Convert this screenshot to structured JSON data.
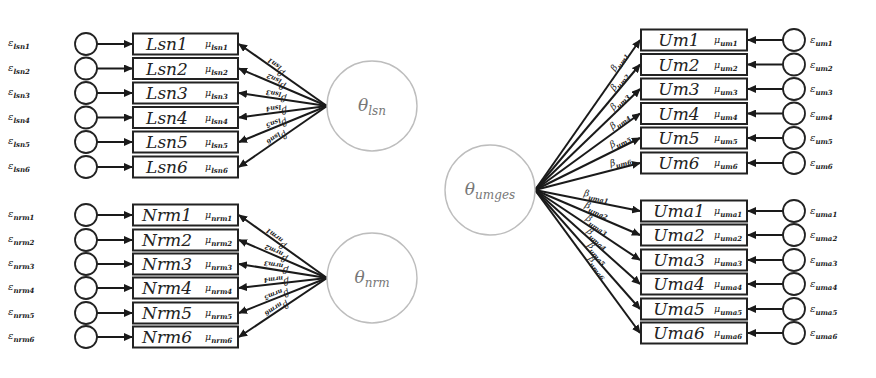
{
  "colors": {
    "line": "#1a1a1a",
    "box_stroke": "#222222",
    "latent_stroke": "#bdbdbd",
    "latent_text": "#777777",
    "background": "#ffffff"
  },
  "latents": {
    "lsn": {
      "symbol": "θ",
      "sub": "lsn",
      "cx": 372,
      "cy": 106,
      "r": 45
    },
    "nrm": {
      "symbol": "θ",
      "sub": "nrm",
      "cx": 372,
      "cy": 278,
      "r": 45
    },
    "umges": {
      "symbol": "θ",
      "sub": "umges",
      "cx": 490,
      "cy": 190,
      "r": 45
    }
  },
  "groups": {
    "lsn": {
      "side": "left",
      "latent": "lsn",
      "indicators": [
        {
          "label": "Lsn1",
          "mu": "lsn1",
          "err": "lsn1",
          "beta": "lsn1",
          "cy": 44
        },
        {
          "label": "Lsn2",
          "mu": "lsn2",
          "err": "lsn2",
          "beta": "lsn2",
          "cy": 68.5
        },
        {
          "label": "Lsn3",
          "mu": "lsn3",
          "err": "lsn3",
          "beta": "lsn3",
          "cy": 93
        },
        {
          "label": "Lsn4",
          "mu": "lsn4",
          "err": "lsn4",
          "beta": "lsn4",
          "cy": 117.5
        },
        {
          "label": "Lsn5",
          "mu": "lsn5",
          "err": "lsn5",
          "beta": "lsn5",
          "cy": 142
        },
        {
          "label": "Lsn6",
          "mu": "lsn6",
          "err": "lsn6",
          "beta": "lsn6",
          "cy": 167
        }
      ]
    },
    "nrm": {
      "side": "left",
      "latent": "nrm",
      "indicators": [
        {
          "label": "Nrm1",
          "mu": "nrm1",
          "err": "nrm1",
          "beta": "nrm1",
          "cy": 215
        },
        {
          "label": "Nrm2",
          "mu": "nrm2",
          "err": "nrm2",
          "beta": "nrm2",
          "cy": 240
        },
        {
          "label": "Nrm3",
          "mu": "nrm3",
          "err": "nrm3",
          "beta": "nrm3",
          "cy": 264
        },
        {
          "label": "Nrm4",
          "mu": "nrm4",
          "err": "nrm4",
          "beta": "nrm4",
          "cy": 288
        },
        {
          "label": "Nrm5",
          "mu": "nrm5",
          "err": "nrm5",
          "beta": "nrm5",
          "cy": 313
        },
        {
          "label": "Nrm6",
          "mu": "nrm6",
          "err": "nrm6",
          "beta": "nrm6",
          "cy": 337
        }
      ]
    },
    "um": {
      "side": "right",
      "latent": "umges",
      "indicators": [
        {
          "label": "Um1",
          "mu": "um1",
          "err": "um1",
          "beta": "um1",
          "cy": 40
        },
        {
          "label": "Um2",
          "mu": "um2",
          "err": "um2",
          "beta": "um2",
          "cy": 64.5
        },
        {
          "label": "Um3",
          "mu": "um3",
          "err": "um3",
          "beta": "um3",
          "cy": 89
        },
        {
          "label": "Um4",
          "mu": "um4",
          "err": "um4",
          "beta": "um4",
          "cy": 113.5
        },
        {
          "label": "Um5",
          "mu": "um5",
          "err": "um5",
          "beta": "um5",
          "cy": 138
        },
        {
          "label": "Um6",
          "mu": "um6",
          "err": "um6",
          "beta": "um6",
          "cy": 163
        }
      ]
    },
    "uma": {
      "side": "right",
      "latent": "umges",
      "indicators": [
        {
          "label": "Uma1",
          "mu": "uma1",
          "err": "uma1",
          "beta": "uma1",
          "cy": 211
        },
        {
          "label": "Uma2",
          "mu": "uma2",
          "err": "uma2",
          "beta": "uma2",
          "cy": 235
        },
        {
          "label": "Uma3",
          "mu": "uma3",
          "err": "uma3",
          "beta": "uma3",
          "cy": 260
        },
        {
          "label": "Uma4",
          "mu": "uma4",
          "err": "uma4",
          "beta": "uma4",
          "cy": 284
        },
        {
          "label": "Uma5",
          "mu": "uma5",
          "err": "uma5",
          "beta": "uma5",
          "cy": 309
        },
        {
          "label": "Uma6",
          "mu": "uma6",
          "err": "uma6",
          "beta": "uma6",
          "cy": 333
        }
      ]
    }
  },
  "symbols": {
    "mu": "μ",
    "epsilon": "ε",
    "beta": "β"
  },
  "layout": {
    "left": {
      "box_x": 133,
      "box_w": 105,
      "box_h": 21,
      "err_cx": 86,
      "err_r": 11,
      "err_label_x": 8
    },
    "right": {
      "box_x": 641,
      "box_w": 106,
      "box_h": 21,
      "err_cx": 794,
      "err_r": 11,
      "err_label_x": 810
    }
  }
}
